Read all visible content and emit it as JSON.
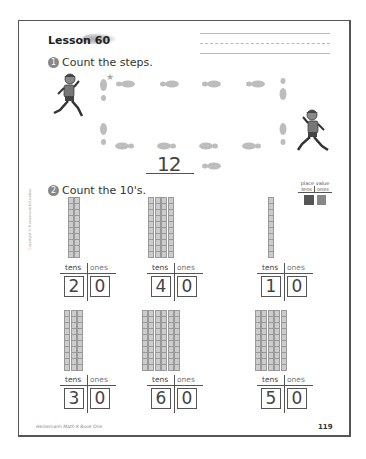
{
  "page": {
    "lesson_title": "Lesson 60",
    "page_number": "119",
    "footer_text": "Heinemann Math K Book One",
    "copyright": "Copyright © Heinemann Education"
  },
  "question1": {
    "number": "1",
    "prompt": "Count the steps.",
    "answer": "12",
    "footprints_count": 12
  },
  "question2": {
    "number": "2",
    "prompt": "Count the 10's.",
    "place_value_key": {
      "title": "place value",
      "tens": "tens",
      "ones": "ones"
    },
    "column_labels": {
      "tens": "tens",
      "ones": "ones"
    },
    "items": [
      {
        "rods": 2,
        "tens": "2",
        "ones": "0"
      },
      {
        "rods": 4,
        "tens": "4",
        "ones": "0"
      },
      {
        "rods": 1,
        "tens": "1",
        "ones": "0"
      },
      {
        "rods": 3,
        "tens": "3",
        "ones": "0"
      },
      {
        "rods": 6,
        "tens": "6",
        "ones": "0"
      },
      {
        "rods": 5,
        "tens": "5",
        "ones": "0"
      }
    ]
  },
  "colors": {
    "footprint": "#bdbdbd",
    "rod_fill": "#cccccc",
    "pv_tens": "#555555",
    "pv_ones": "#888888"
  }
}
